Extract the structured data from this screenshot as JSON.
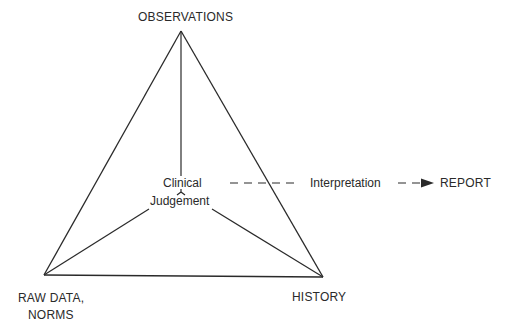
{
  "diagram": {
    "nodes": {
      "top": "OBSERVATIONS",
      "center_line1": "Clinical",
      "center_line2": "Judgement",
      "bottom_left_line1": "RAW DATA,",
      "bottom_left_line2": "NORMS",
      "bottom_right": "HISTORY"
    },
    "flow": {
      "process": "Interpretation",
      "output": "REPORT"
    },
    "colors": {
      "line": "#2a2a2a",
      "background": "#ffffff"
    }
  }
}
